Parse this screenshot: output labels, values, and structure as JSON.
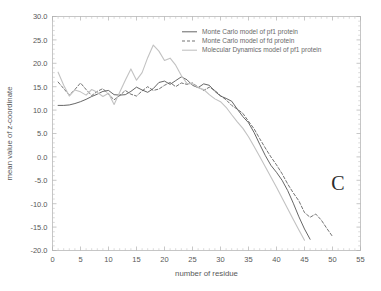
{
  "chart_data": {
    "type": "line",
    "title": "",
    "panel_label": "C",
    "xlabel": "number of residue",
    "ylabel": "mean value of z-coordinate",
    "xlim": [
      0,
      55
    ],
    "ylim": [
      -20.0,
      30.0
    ],
    "xticks": [
      0,
      5,
      10,
      15,
      20,
      25,
      30,
      35,
      40,
      45,
      50,
      55
    ],
    "xtick_labels": [
      "0",
      "5",
      "10",
      "15",
      "20",
      "25",
      "30",
      "35",
      "40",
      "45",
      "50",
      "55"
    ],
    "yticks": [
      -20.0,
      -15.0,
      -10.0,
      -5.0,
      0.0,
      5.0,
      10.0,
      15.0,
      20.0,
      25.0,
      30.0
    ],
    "ytick_labels": [
      "-20.0",
      "-15.0",
      "-10.0",
      "-5.0",
      "0.0",
      "5.0",
      "10.0",
      "15.0",
      "20.0",
      "25.0",
      "30.0"
    ],
    "grid": false,
    "legend_position": "top-center-right",
    "series": [
      {
        "name": "Monte Carlo model of pf1 protein",
        "style": "solid",
        "color": "#4a4a4a",
        "x": [
          1,
          2,
          3,
          4,
          5,
          6,
          7,
          8,
          9,
          10,
          11,
          12,
          13,
          14,
          15,
          16,
          17,
          18,
          19,
          20,
          21,
          22,
          23,
          24,
          25,
          26,
          27,
          28,
          29,
          30,
          31,
          32,
          33,
          34,
          35,
          36,
          37,
          38,
          39,
          40,
          41,
          42,
          43,
          44,
          45,
          46
        ],
        "y": [
          11.0,
          11.0,
          11.1,
          11.4,
          11.8,
          12.3,
          12.9,
          13.4,
          14.0,
          14.2,
          13.3,
          13.2,
          13.3,
          14.0,
          14.9,
          14.3,
          13.8,
          14.6,
          15.9,
          16.2,
          15.5,
          16.3,
          17.1,
          16.5,
          15.3,
          14.8,
          15.6,
          15.3,
          14.0,
          13.0,
          12.5,
          11.9,
          10.2,
          8.6,
          7.3,
          5.2,
          2.7,
          0.3,
          -1.8,
          -3.3,
          -5.0,
          -7.2,
          -9.9,
          -12.8,
          -15.4,
          -17.6
        ]
      },
      {
        "name": "Monte Carlo model of fd protein",
        "style": "dashed",
        "color": "#5a5a5a",
        "x": [
          1,
          2,
          3,
          4,
          5,
          6,
          7,
          8,
          9,
          10,
          11,
          12,
          13,
          14,
          15,
          16,
          17,
          18,
          19,
          20,
          21,
          22,
          23,
          24,
          25,
          26,
          27,
          28,
          29,
          30,
          31,
          32,
          33,
          34,
          35,
          36,
          37,
          38,
          39,
          40,
          41,
          42,
          43,
          44,
          45,
          46,
          47,
          48,
          49,
          50
        ],
        "y": [
          16.0,
          14.6,
          13.2,
          14.4,
          15.8,
          14.4,
          13.1,
          14.0,
          14.6,
          13.4,
          12.2,
          13.1,
          14.2,
          13.4,
          13.0,
          14.1,
          15.0,
          14.2,
          14.5,
          15.3,
          15.9,
          15.0,
          15.8,
          15.5,
          15.8,
          14.9,
          14.2,
          14.9,
          14.2,
          13.1,
          12.2,
          11.0,
          10.2,
          9.3,
          7.6,
          6.0,
          3.9,
          1.9,
          0.0,
          -1.7,
          -3.6,
          -5.8,
          -7.7,
          -9.4,
          -11.9,
          -12.9,
          -12.2,
          -13.5,
          -15.3,
          -17.0
        ]
      },
      {
        "name": "Molecular Dynamics model of pf1 protein",
        "style": "solid",
        "color": "#c2c2c2",
        "x": [
          1,
          2,
          3,
          4,
          5,
          6,
          7,
          8,
          9,
          10,
          11,
          12,
          13,
          14,
          15,
          16,
          17,
          18,
          19,
          20,
          21,
          22,
          23,
          24,
          25,
          26,
          27,
          28,
          29,
          30,
          31,
          32,
          33,
          34,
          35,
          36,
          37,
          38,
          39,
          40,
          41,
          42,
          43,
          44,
          45
        ],
        "y": [
          18.1,
          15.3,
          13.0,
          14.3,
          13.9,
          13.2,
          14.4,
          13.8,
          12.9,
          13.6,
          11.2,
          13.8,
          16.4,
          18.8,
          16.4,
          18.0,
          21.2,
          23.9,
          22.6,
          20.6,
          21.1,
          19.6,
          17.4,
          15.7,
          15.6,
          14.8,
          14.4,
          13.3,
          12.4,
          11.8,
          10.6,
          9.0,
          7.5,
          6.1,
          4.3,
          2.2,
          0.1,
          -2.1,
          -4.3,
          -6.5,
          -8.8,
          -11.1,
          -13.4,
          -15.6,
          -17.8
        ]
      }
    ]
  },
  "legend": {
    "entries": [
      "Monte Carlo model of pf1 protein",
      "Monte Carlo model of fd protein",
      "Molecular Dynamics model of pf1 protein"
    ]
  },
  "colors": {
    "mc_pf1": "#4a4a4a",
    "mc_fd": "#5a5a5a",
    "md_pf1": "#c2c2c2",
    "frame": "#b9b9b9",
    "text": "#585858"
  }
}
